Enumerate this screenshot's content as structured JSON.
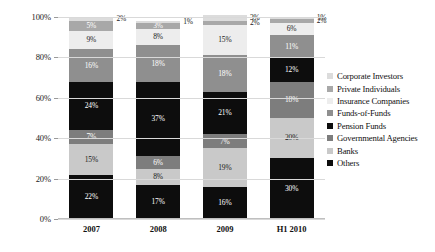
{
  "chart_data": {
    "type": "bar",
    "stacked": true,
    "title": "",
    "subtitle": "",
    "xlabel": "",
    "ylabel": "",
    "categories": [
      "2007",
      "2008",
      "2009",
      "H1 2010"
    ],
    "ylim": [
      0,
      100
    ],
    "ytick_labels": [
      "0%",
      "20%",
      "40%",
      "60%",
      "80%",
      "100%"
    ],
    "ytick_values": [
      0,
      20,
      40,
      60,
      80,
      100
    ],
    "grid": true,
    "legend_position": "right",
    "stack_order_top_to_bottom": [
      "Corporate Investors",
      "Private Individuals",
      "Insurance Companies",
      "Funds-of-Funds",
      "Pension Funds",
      "Governmental Agencies",
      "Banks",
      "Others"
    ],
    "series": [
      {
        "name": "Others",
        "color": "#0d0d0d",
        "label_on_dark": true,
        "values": [
          22,
          17,
          16,
          30
        ],
        "labels": [
          "22%",
          "17%",
          "16%",
          "30%"
        ]
      },
      {
        "name": "Banks",
        "color": "#c9c9c9",
        "label_on_dark": false,
        "values": [
          15,
          8,
          19,
          20
        ],
        "labels": [
          "15%",
          "8%",
          "19%",
          "20%"
        ]
      },
      {
        "name": "Governmental Agencies",
        "color": "#7d7d7d",
        "label_on_dark": true,
        "values": [
          7,
          6,
          7,
          18
        ],
        "labels": [
          "7%",
          "6%",
          "7%",
          "18%"
        ]
      },
      {
        "name": "Pension Funds",
        "color": "#0d0d0d",
        "label_on_dark": true,
        "values": [
          24,
          37,
          21,
          12
        ],
        "labels": [
          "24%",
          "37%",
          "21%",
          "12%"
        ]
      },
      {
        "name": "Funds-of-Funds",
        "color": "#8f8f8f",
        "label_on_dark": true,
        "values": [
          16,
          18,
          18,
          11
        ],
        "labels": [
          "16%",
          "18%",
          "18%",
          "11%"
        ]
      },
      {
        "name": "Insurance Companies",
        "color": "#ededed",
        "label_on_dark": false,
        "values": [
          9,
          8,
          15,
          6
        ],
        "labels": [
          "9%",
          "8%",
          "15%",
          "6%"
        ]
      },
      {
        "name": "Private Individuals",
        "color": "#a8a8a8",
        "label_on_dark": true,
        "values": [
          5,
          3,
          2,
          2
        ],
        "labels": [
          "5%",
          "3%",
          "2%",
          "2%"
        ],
        "label_outside": [
          false,
          false,
          true,
          true
        ]
      },
      {
        "name": "Corporate Investors",
        "color": "#dcdcdc",
        "label_on_dark": false,
        "values": [
          2,
          1,
          3,
          1
        ],
        "labels": [
          "2%",
          "1%",
          "3%",
          "1%"
        ],
        "label_outside": [
          true,
          true,
          true,
          true
        ]
      }
    ]
  },
  "legend": {
    "items": [
      {
        "label": "Corporate Investors",
        "color": "#dcdcdc"
      },
      {
        "label": "Private Individuals",
        "color": "#a8a8a8"
      },
      {
        "label": "Insurance Companies",
        "color": "#ededed"
      },
      {
        "label": "Funds-of-Funds",
        "color": "#8f8f8f"
      },
      {
        "label": "Pension Funds",
        "color": "#0d0d0d"
      },
      {
        "label": "Governmental Agencies",
        "color": "#7d7d7d"
      },
      {
        "label": "Banks",
        "color": "#c9c9c9"
      },
      {
        "label": "Others",
        "color": "#0d0d0d"
      }
    ]
  },
  "axes": {
    "y_ticks": [
      "100%",
      "80%",
      "60%",
      "40%",
      "20%",
      "0%"
    ],
    "x_ticks": [
      "2007",
      "2008",
      "2009",
      "H1 2010"
    ]
  }
}
